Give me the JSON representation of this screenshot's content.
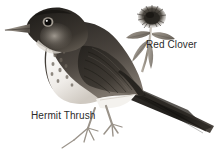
{
  "scene": {
    "title": "Hermit Thrush and Red Clover illustration",
    "background_color": "#ffffff",
    "width": 216,
    "height": 159,
    "style": "grayscale pen-and-ink natural history illustration"
  },
  "labels": {
    "bird": "Hermit Thrush",
    "flower": "Red Clover"
  },
  "subjects": {
    "bird": {
      "name": "Hermit Thrush",
      "icon": "bird-illustration",
      "description": "perched thrush facing left with long tail to the right, spotted pale breast, dark brown upperparts, thin legs"
    },
    "flower": {
      "name": "Red Clover",
      "icon": "clover-illustration",
      "description": "single globular fuzzy clover bloom on a slender stem with two leaves"
    }
  },
  "colors": {
    "text": "#2b2b2b",
    "background": "#ffffff",
    "ink_dark": "#1c1c1c",
    "ink_mid": "#6b6b6b",
    "ink_light": "#bdbdbd"
  }
}
